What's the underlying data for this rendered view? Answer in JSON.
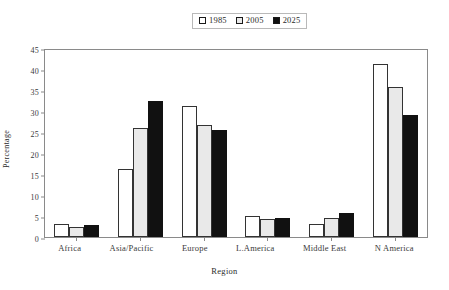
{
  "chart_data": {
    "type": "bar",
    "title": "",
    "xlabel": "Region",
    "ylabel": "Percentage",
    "categories": [
      "Africa",
      "Asia/Pacific",
      "Europe",
      "L.America",
      "Middle East",
      "N America"
    ],
    "series": [
      {
        "name": "1985",
        "color": "#ffffff",
        "values": [
          3.0,
          16.2,
          31.3,
          5.1,
          3.1,
          41.3
        ]
      },
      {
        "name": "2005",
        "color": "#e9e9e9",
        "values": [
          2.3,
          25.9,
          26.7,
          4.3,
          4.5,
          35.8
        ]
      },
      {
        "name": "2025",
        "color": "#111111",
        "values": [
          2.8,
          32.5,
          25.4,
          4.5,
          5.6,
          29.0
        ]
      }
    ],
    "ylim": [
      0,
      45
    ],
    "y_ticks": [
      0,
      5,
      10,
      15,
      20,
      25,
      30,
      35,
      40,
      45
    ],
    "grid": false,
    "legend_position": "top-center"
  },
  "legend": {
    "entries": [
      {
        "label": "1985",
        "swatch": "open-square-icon"
      },
      {
        "label": "2005",
        "swatch": "light-gray-square-icon"
      },
      {
        "label": "2025",
        "swatch": "filled-black-square-icon"
      }
    ]
  },
  "axes": {
    "y_title": "Percentage",
    "x_title": "Region"
  }
}
